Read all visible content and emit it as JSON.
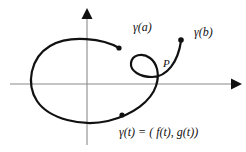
{
  "figure": {
    "background_color": "#ffffff",
    "curve_color": "#111111",
    "axis_color": "#808080",
    "labels": {
      "gamma_a": "γ(a)",
      "gamma_b": "γ(b)",
      "point_p": "P",
      "parametrization": "γ(t) = ( f(t), g(t))"
    },
    "axes": {
      "x_axis": {
        "label": "",
        "origin_x": 87,
        "y": 84,
        "start_x": 10,
        "end_x": 238,
        "arrow": "right"
      },
      "y_axis": {
        "label": "",
        "origin_y": 84,
        "x": 87,
        "start_y": 145,
        "end_y": 12,
        "arrow": "up"
      }
    },
    "points": [
      {
        "name": "gamma-a-endpoint",
        "x": 119,
        "y": 48
      },
      {
        "name": "gamma-b-endpoint",
        "x": 181,
        "y": 40
      },
      {
        "name": "gamma-t-marker",
        "x": 122,
        "y": 115
      },
      {
        "name": "self-intersection-p",
        "x": 157,
        "y": 70
      }
    ],
    "curve": {
      "description": "large oval opening at upper right, sweeping counterclockwise into a small loop with a self-intersection at P, then out to gamma(b)",
      "path": "M 119 48 C 100 39 62 36 46 48 C 27 61 28 86 38 101 C 50 118 82 126 108 121 C 132 116 150 102 155 86 C 159 73 156 63 150 58 C 143 52 134 55 133 62 C 132 70 140 76 152 76 C 166 76 177 63 181 40"
    }
  }
}
